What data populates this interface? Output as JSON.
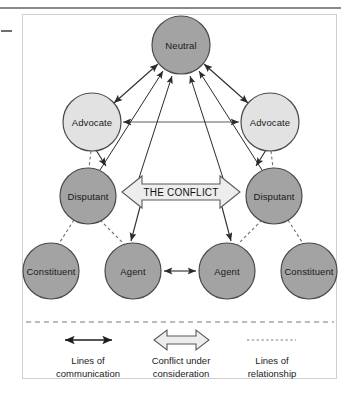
{
  "figure": {
    "title_rule_present": true,
    "colors": {
      "dark_node_fill": "#a3a3a3",
      "light_node_fill": "#e2e2e2",
      "node_stroke": "#4a4a4a",
      "conflict_fill": "#ededed",
      "conflict_stroke": "#5a5a5a",
      "line": "#2b2b2b",
      "dashed_line": "#6f6f6f",
      "frame": "#c9c9c9",
      "text": "#1a1a1a"
    },
    "nodes": [
      {
        "id": "neutral",
        "label": "Neutral",
        "cx": 181,
        "cy": 45,
        "r": 29,
        "tone": "dark"
      },
      {
        "id": "advocate-left",
        "label": "Advocate",
        "cx": 92,
        "cy": 122,
        "r": 29,
        "tone": "light"
      },
      {
        "id": "advocate-right",
        "label": "Advocate",
        "cx": 270,
        "cy": 122,
        "r": 29,
        "tone": "light"
      },
      {
        "id": "disputant-left",
        "label": "Disputant",
        "cx": 88,
        "cy": 196,
        "r": 28,
        "tone": "dark"
      },
      {
        "id": "disputant-right",
        "label": "Disputant",
        "cx": 274,
        "cy": 196,
        "r": 28,
        "tone": "dark"
      },
      {
        "id": "constituent-left",
        "label": "Constituent",
        "cx": 51,
        "cy": 271,
        "r": 28,
        "tone": "dark"
      },
      {
        "id": "agent-left",
        "label": "Agent",
        "cx": 133,
        "cy": 271,
        "r": 28,
        "tone": "dark"
      },
      {
        "id": "agent-right",
        "label": "Agent",
        "cx": 227,
        "cy": 271,
        "r": 28,
        "tone": "dark"
      },
      {
        "id": "constituent-right",
        "label": "Constituent",
        "cx": 309,
        "cy": 271,
        "r": 28,
        "tone": "dark"
      }
    ],
    "conflict_arrow": {
      "label": "THE CONFLICT",
      "cx": 181,
      "cy": 192
    },
    "legend": {
      "items": [
        {
          "id": "lines-of-communication",
          "symbol": "double-headed-solid-arrow",
          "line1": "Lines of",
          "line2": "communication"
        },
        {
          "id": "conflict-under-consideration",
          "symbol": "hollow-double-arrow",
          "line1": "Conflict under",
          "line2": "consideration"
        },
        {
          "id": "lines-of-relationship",
          "symbol": "dotted-line",
          "line1": "Lines of",
          "line2": "relationship"
        }
      ]
    }
  }
}
